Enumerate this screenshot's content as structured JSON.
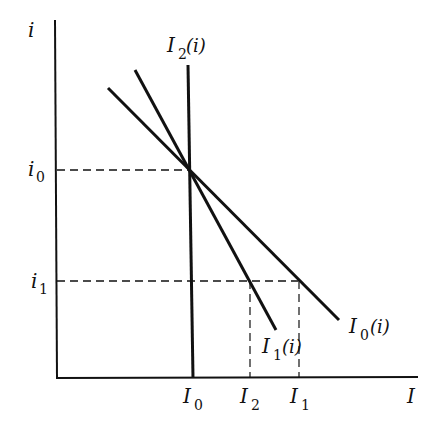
{
  "diagram": {
    "axes": {
      "y_label": "i",
      "x_label": "I"
    },
    "y_ticks": [
      {
        "id": "i0",
        "base": "i",
        "sub": "0"
      },
      {
        "id": "i1",
        "base": "i",
        "sub": "1"
      }
    ],
    "x_ticks": [
      {
        "id": "I0",
        "base": "I",
        "sub": "0"
      },
      {
        "id": "I2",
        "base": "I",
        "sub": "2"
      },
      {
        "id": "I1",
        "base": "I",
        "sub": "1"
      }
    ],
    "curves": [
      {
        "id": "I2_of_i",
        "base": "I",
        "sub": "2",
        "arg": "(i)",
        "kind": "vertical line"
      },
      {
        "id": "I1_of_i",
        "base": "I",
        "sub": "1",
        "arg": "(i)",
        "kind": "steep downward line"
      },
      {
        "id": "I0_of_i",
        "base": "I",
        "sub": "0",
        "arg": "(i)",
        "kind": "flatter downward line"
      }
    ],
    "colors": {
      "ink": "#111111",
      "background": "#ffffff"
    }
  }
}
